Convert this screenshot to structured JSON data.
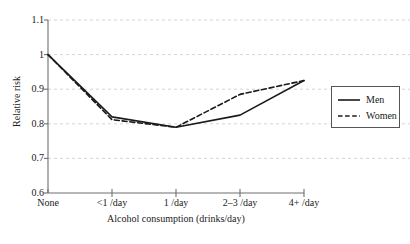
{
  "chart_data": {
    "type": "line",
    "title": "",
    "xlabel": "Alcohol consumption (drinks/day)",
    "ylabel": "Relative risk",
    "categories": [
      "None",
      "<1 /day",
      "1 /day",
      "2–3 /day",
      "4+ /day"
    ],
    "ylim": [
      0.6,
      1.1
    ],
    "yticks": [
      0.6,
      0.7,
      0.8,
      0.9,
      1.0,
      1.1
    ],
    "ytick_labels": [
      "0.6",
      "0.7",
      "0.8",
      "0.9",
      "1",
      "1.1"
    ],
    "grid": "horizontal-dashed",
    "legend_position": "right-outside",
    "series": [
      {
        "name": "Men",
        "style": "solid",
        "color": "#1a1a1a",
        "values": [
          1.0,
          0.82,
          0.79,
          0.825,
          0.925
        ]
      },
      {
        "name": "Women",
        "style": "dashed",
        "color": "#1a1a1a",
        "values": [
          1.0,
          0.812,
          0.79,
          0.885,
          0.925
        ]
      }
    ]
  },
  "axes": {
    "y_title": "Relative risk",
    "x_title": "Alcohol consumption (drinks/day)",
    "y_labels": [
      "1.1",
      "1",
      "0.9",
      "0.8",
      "0.7",
      "0.6"
    ],
    "x_labels": [
      "None",
      "<1 /day",
      "1 /day",
      "2–3 /day",
      "4+ /day"
    ]
  },
  "legend": {
    "entries": [
      {
        "label": "Men",
        "style": "solid"
      },
      {
        "label": "Women",
        "style": "dashed"
      }
    ]
  }
}
